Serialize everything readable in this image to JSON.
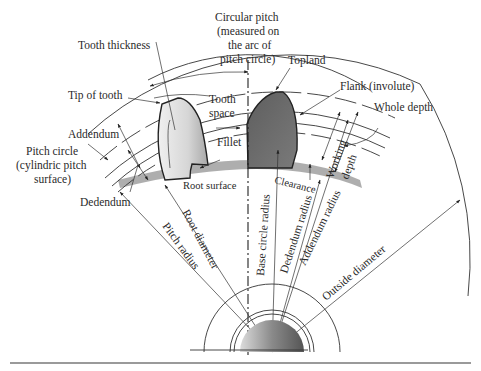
{
  "figure": {
    "colors": {
      "background": "#ffffff",
      "line": "#333333",
      "left_tooth_light": "#e6e6e6",
      "left_tooth_dark": "#a8a8a8",
      "right_tooth": "#6e6e6e",
      "root_band": "#9a9a9a",
      "bottom_rule": "#9a9a9a"
    },
    "labels": {
      "circular_pitch_1": "Circular pitch",
      "circular_pitch_2": "(measured on",
      "circular_pitch_3": "the arc of",
      "circular_pitch_4": "pitch circle)",
      "tooth_thickness": "Tooth thickness",
      "topland": "Topland",
      "flank": "Flank (involute)",
      "whole_depth": "Whole depth",
      "tip_of_tooth": "Tip of tooth",
      "tooth_space_1": "Tooth",
      "tooth_space_2": "space",
      "addendum": "Addendum",
      "working_depth_1": "Working",
      "working_depth_2": "depth",
      "fillet": "Fillet",
      "pitch_circle_1": "Pitch circle",
      "pitch_circle_2": "(cylindric pitch",
      "pitch_circle_3": "surface)",
      "root_surface": "Root surface",
      "clearance": "Clearance",
      "dedendum": "Dedendum",
      "root_diameter": "Root diameter",
      "pitch_radius": "Pitch radius",
      "base_circle_radius": "Base circle radius",
      "dedendum_radius": "Dedendum radius",
      "addendum_radius": "Addendum radius",
      "outside_diameter": "Outside diameter"
    }
  }
}
